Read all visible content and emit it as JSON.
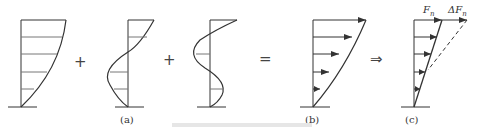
{
  "figure": {
    "operators": {
      "plus1": "+",
      "plus2": "+",
      "equals": "=",
      "implies": "⇒"
    },
    "panel_labels": {
      "a": "(a)",
      "b": "(b)",
      "c": "(c)"
    },
    "force_labels": {
      "fn": "F",
      "fn_sub": "n",
      "delta_fn": "ΔF",
      "delta_fn_sub": "n"
    },
    "caption": ""
  }
}
